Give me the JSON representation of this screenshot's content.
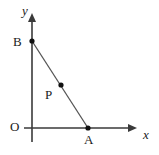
{
  "figure": {
    "width": 159,
    "height": 155,
    "background_color": "#ffffff",
    "axis_color": "#3a3a3a",
    "segment_color": "#555555",
    "point_color": "#111111",
    "label_color": "#1a1a1a"
  },
  "axes": {
    "origin": {
      "label": "O",
      "x": 32,
      "y": 128
    },
    "x_axis": {
      "label": "x",
      "italic": true,
      "start_x": 24,
      "end_x": 137,
      "y": 128,
      "arrow": "right"
    },
    "y_axis": {
      "label": "y",
      "italic": true,
      "x": 32,
      "start_y": 142,
      "end_y": 13,
      "arrow": "up"
    }
  },
  "points": [
    {
      "name": "B",
      "label": "B",
      "x": 32,
      "y": 41,
      "on_axis": "y",
      "radius": 2.6
    },
    {
      "name": "P",
      "label": "P",
      "x": 61,
      "y": 85,
      "on_axis": "segment",
      "radius": 2.6
    },
    {
      "name": "A",
      "label": "A",
      "x": 88,
      "y": 128,
      "on_axis": "x",
      "radius": 2.6
    }
  ],
  "segments": [
    {
      "name": "segment-BA",
      "from": "B",
      "to": "A",
      "x1": 32,
      "y1": 41,
      "x2": 88,
      "y2": 128
    }
  ],
  "labels": {
    "origin": "O",
    "point_b": "B",
    "point_p": "P",
    "point_a": "A",
    "x_axis": "x",
    "y_axis": "y"
  }
}
